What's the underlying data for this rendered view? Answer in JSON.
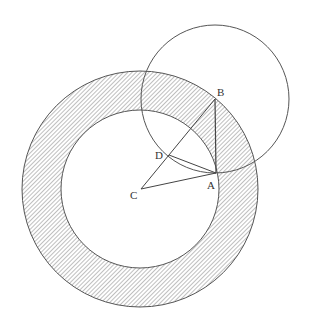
{
  "figure": {
    "width": 309,
    "height": 327,
    "background": "#ffffff",
    "stroke_color": "#555555",
    "hatch_color": "#8a8a8a",
    "annulus": {
      "center": [
        140,
        189
      ],
      "outer_radius": 118,
      "inner_radius": 79,
      "fill": "diagonal-hatch"
    },
    "circle_b": {
      "center": [
        215,
        99
      ],
      "radius": 74
    },
    "points": {
      "A": {
        "label": "A",
        "x": 216,
        "y": 173
      },
      "B": {
        "label": "B",
        "x": 215,
        "y": 99
      },
      "C": {
        "label": "C",
        "x": 141,
        "y": 189
      },
      "D": {
        "label": "D",
        "x": 169,
        "y": 155
      }
    },
    "segments": [
      [
        "C",
        "A"
      ],
      [
        "C",
        "B"
      ],
      [
        "B",
        "A"
      ],
      [
        "D",
        "A"
      ]
    ]
  }
}
